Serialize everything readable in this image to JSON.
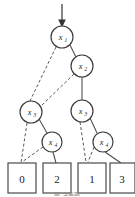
{
  "figure": {
    "kind": "binary-decision-diagram",
    "background_color": "#ffffff",
    "line_color": "#4a4a4a",
    "text_color": "#1a1a1a",
    "entry_arrow": {
      "label": "root-entry-arrow",
      "from_y": 4,
      "to_y": 26,
      "x": 62
    },
    "caption": "图 决策图"
  },
  "nodes": [
    {
      "id": "n1",
      "var": "x",
      "subscript": "1",
      "label": "x1",
      "cx": 62,
      "cy": 37,
      "r": 11
    },
    {
      "id": "n2",
      "var": "x",
      "subscript": "2",
      "label": "x2",
      "cx": 82,
      "cy": 66,
      "r": 11
    },
    {
      "id": "n3l",
      "var": "x",
      "subscript": "3",
      "label": "x3",
      "cx": 31,
      "cy": 112,
      "r": 11
    },
    {
      "id": "n3r",
      "var": "x",
      "subscript": "3",
      "label": "x3",
      "cx": 82,
      "cy": 111,
      "r": 11
    },
    {
      "id": "n4l",
      "var": "x",
      "subscript": "4",
      "label": "x4",
      "cx": 52,
      "cy": 142,
      "r": 10
    },
    {
      "id": "n4r",
      "var": "x",
      "subscript": "4",
      "label": "x4",
      "cx": 103,
      "cy": 142,
      "r": 10
    }
  ],
  "terminals": [
    {
      "id": "t0",
      "value": "0",
      "x": 8,
      "y": 163,
      "w": 28,
      "h": 30
    },
    {
      "id": "t2",
      "value": "2",
      "x": 43,
      "y": 163,
      "w": 28,
      "h": 30
    },
    {
      "id": "t1",
      "value": "1",
      "x": 78,
      "y": 163,
      "w": 28,
      "h": 30
    },
    {
      "id": "t3",
      "value": "3",
      "x": 110,
      "y": 163,
      "w": 25,
      "h": 30
    }
  ],
  "edges": [
    {
      "id": "e1",
      "from": "n1",
      "to": "n3l",
      "style": "dashed",
      "branch": "low",
      "x1": 56,
      "y1": 47,
      "x2": 30,
      "y2": 101
    },
    {
      "id": "e2",
      "from": "n1",
      "to": "n2",
      "style": "solid",
      "branch": "high",
      "x1": 70,
      "y1": 45,
      "x2": 76,
      "y2": 57
    },
    {
      "id": "e3",
      "from": "n2",
      "to": "n3l",
      "style": "dashed",
      "branch": "low",
      "x1": 74,
      "y1": 74,
      "x2": 41,
      "y2": 106
    },
    {
      "id": "e4",
      "from": "n2",
      "to": "n3r",
      "style": "solid",
      "branch": "high",
      "x1": 82,
      "y1": 77,
      "x2": 82,
      "y2": 100
    },
    {
      "id": "e5",
      "from": "n3l",
      "to": "t0",
      "style": "dashed",
      "branch": "low",
      "x1": 27,
      "y1": 123,
      "x2": 21,
      "y2": 163
    },
    {
      "id": "e6",
      "from": "n3l",
      "to": "n4l",
      "style": "solid",
      "branch": "high",
      "x1": 39,
      "y1": 119,
      "x2": 47,
      "y2": 133
    },
    {
      "id": "e7",
      "from": "n4l",
      "to": "t0",
      "style": "dashed",
      "branch": "low",
      "x1": 43,
      "y1": 147,
      "x2": 22,
      "y2": 163
    },
    {
      "id": "e8",
      "from": "n4l",
      "to": "t2",
      "style": "solid",
      "branch": "high",
      "x1": 53,
      "y1": 152,
      "x2": 55,
      "y2": 163
    },
    {
      "id": "e9",
      "from": "n3r",
      "to": "t1",
      "style": "dashed",
      "branch": "low",
      "x1": 80,
      "y1": 122,
      "x2": 86,
      "y2": 163
    },
    {
      "id": "e10",
      "from": "n3r",
      "to": "n4r",
      "style": "solid",
      "branch": "high",
      "x1": 90,
      "y1": 118,
      "x2": 97,
      "y2": 133
    },
    {
      "id": "e11",
      "from": "n4r",
      "to": "t1",
      "style": "dashed",
      "branch": "low",
      "x1": 94,
      "y1": 147,
      "x2": 88,
      "y2": 163
    },
    {
      "id": "e12",
      "from": "n4r",
      "to": "t3",
      "style": "solid",
      "branch": "high",
      "x1": 105,
      "y1": 152,
      "x2": 121,
      "y2": 163
    }
  ]
}
